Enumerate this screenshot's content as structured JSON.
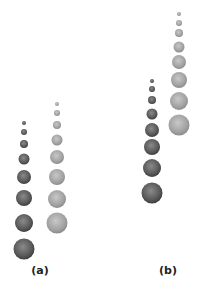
{
  "panels": [
    {
      "label": "(a)",
      "label_pos": [
        40,
        264
      ],
      "columns": [
        {
          "name": "dark",
          "x": 24,
          "color": "#555555",
          "circles": [
            [
              123,
              2
            ],
            [
              132,
              3
            ],
            [
              144,
              4
            ],
            [
              159,
              5.5
            ],
            [
              177,
              7
            ],
            [
              198,
              8
            ],
            [
              223,
              9
            ],
            [
              249,
              10.5
            ]
          ]
        },
        {
          "name": "light",
          "x": 57,
          "color": "#9a9a9a",
          "circles": [
            [
              104,
              2
            ],
            [
              113,
              3
            ],
            [
              125,
              4
            ],
            [
              140,
              5.5
            ],
            [
              157,
              7
            ],
            [
              177,
              8
            ],
            [
              199,
              9
            ],
            [
              223,
              10.5
            ]
          ]
        }
      ]
    },
    {
      "label": "(b)",
      "label_pos": [
        168,
        264
      ],
      "columns": [
        {
          "name": "dark",
          "x": 152,
          "color": "#555555",
          "circles": [
            [
              81,
              2
            ],
            [
              89,
              3
            ],
            [
              100,
              4
            ],
            [
              114,
              5.5
            ],
            [
              130,
              7
            ],
            [
              147,
              8
            ],
            [
              168,
              9
            ],
            [
              193,
              10.5
            ]
          ]
        },
        {
          "name": "light",
          "x": 179,
          "color": "#9a9a9a",
          "circles": [
            [
              14,
              2
            ],
            [
              23,
              3
            ],
            [
              33,
              4
            ],
            [
              47,
              5.5
            ],
            [
              62,
              7
            ],
            [
              80,
              8
            ],
            [
              101,
              9
            ],
            [
              125,
              10.5
            ]
          ]
        }
      ]
    }
  ]
}
